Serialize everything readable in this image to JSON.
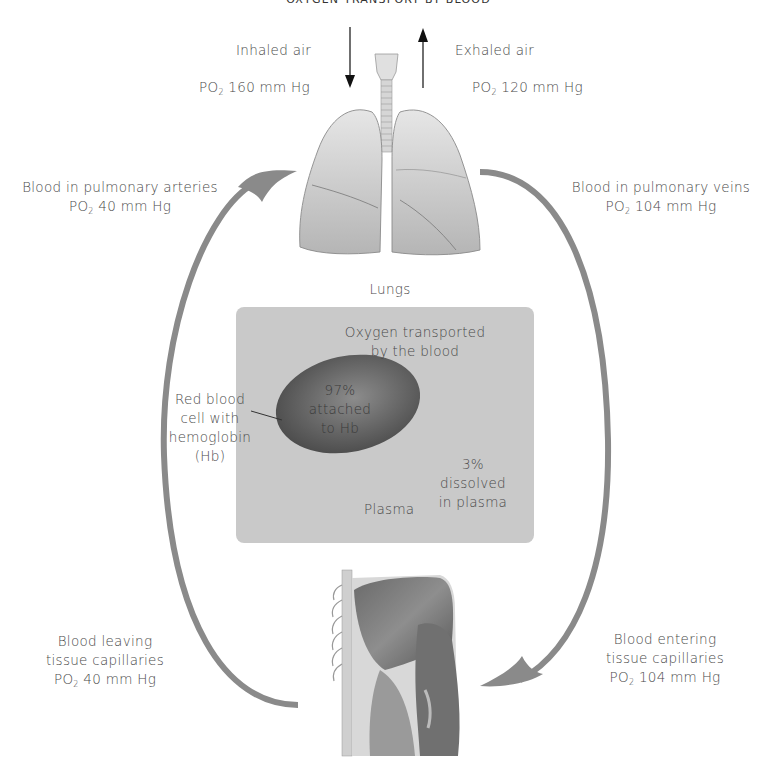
{
  "title": "OXYGEN TRANSPORT BY BLOOD",
  "airflow": {
    "inhaled": {
      "label": "Inhaled air",
      "po2_prefix": "PO",
      "po2_sub": "2",
      "po2_value": "160 mm Hg"
    },
    "exhaled": {
      "label": "Exhaled air",
      "po2_prefix": "PO",
      "po2_sub": "2",
      "po2_value": "120 mm Hg"
    }
  },
  "organs": {
    "lungs_label": "Lungs"
  },
  "circulation": {
    "pulmonary_arteries": {
      "line1": "Blood in pulmonary arteries",
      "po2_prefix": "PO",
      "po2_sub": "2",
      "po2_value": "40 mm Hg"
    },
    "pulmonary_veins": {
      "line1": "Blood in pulmonary veins",
      "po2_prefix": "PO",
      "po2_sub": "2",
      "po2_value": "104 mm Hg"
    },
    "leaving_tissue": {
      "line1": "Blood leaving",
      "line2": "tissue capillaries",
      "po2_prefix": "PO",
      "po2_sub": "2",
      "po2_value": "40 mm Hg"
    },
    "entering_tissue": {
      "line1": "Blood entering",
      "line2": "tissue capillaries",
      "po2_prefix": "PO",
      "po2_sub": "2",
      "po2_value": "104 mm Hg"
    }
  },
  "transport_box": {
    "heading_line1": "Oxygen transported",
    "heading_line2": "by the blood",
    "rbc_label": [
      "Red blood",
      "cell with",
      "hemoglobin",
      "(Hb)"
    ],
    "hb_pct": "97%",
    "hb_line2": "attached",
    "hb_line3": "to Hb",
    "plasma_pct": "3%",
    "plasma_line2": "dissolved",
    "plasma_line3": "in plasma",
    "plasma_label": "Plasma"
  },
  "colors": {
    "arrow": "#8a8a8a",
    "box": "#c9c9c9",
    "rbc": "#5a5a5a",
    "text": "#4a4a4a"
  }
}
